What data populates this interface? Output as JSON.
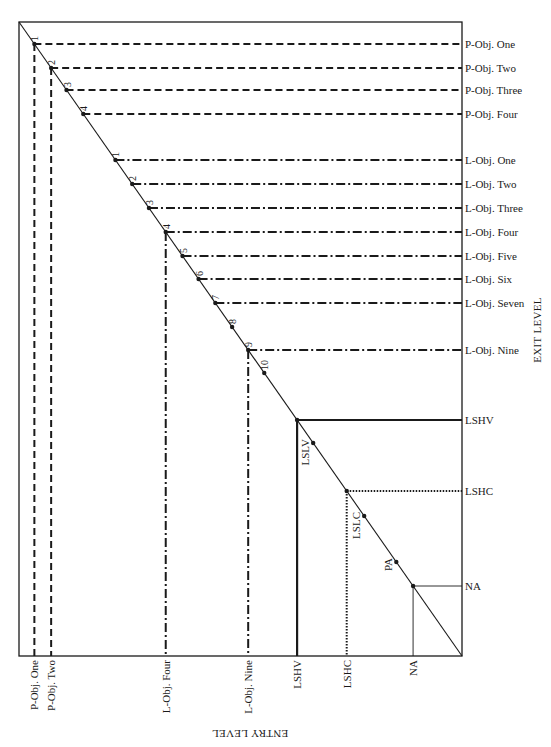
{
  "diagram": {
    "frame": {
      "x0": 19,
      "y0": 22,
      "x1": 462,
      "y1": 656
    },
    "axis_titles": {
      "exit_level": "EXIT LEVEL",
      "entry_level": "ENTRY LEVEL"
    },
    "p_objectives": [
      {
        "num": "1",
        "label": "P-Obj. One",
        "y": 44,
        "drop": true,
        "bottom_label": "P-Obj. One"
      },
      {
        "num": "2",
        "label": "P-Obj. Two",
        "y": 68,
        "drop": true,
        "bottom_label": "P-Obj. Two"
      },
      {
        "num": "3",
        "label": "P-Obj. Three",
        "y": 90,
        "drop": false
      },
      {
        "num": "4",
        "label": "P-Obj. Four",
        "y": 114,
        "drop": false
      }
    ],
    "l_objectives": [
      {
        "num": "1",
        "label": "L-Obj. One",
        "y": 160,
        "line": true
      },
      {
        "num": "2",
        "label": "L-Obj. Two",
        "y": 184,
        "line": true
      },
      {
        "num": "3",
        "label": "L-Obj. Three",
        "y": 208,
        "line": true
      },
      {
        "num": "4",
        "label": "L-Obj. Four",
        "y": 232,
        "line": true,
        "drop": true,
        "bottom_label": "L-Obj. Four"
      },
      {
        "num": "5",
        "label": "L-Obj. Five",
        "y": 256,
        "line": true
      },
      {
        "num": "6",
        "label": "L-Obj. Six",
        "y": 279,
        "line": true
      },
      {
        "num": "7",
        "label": "L-Obj. Seven",
        "y": 303,
        "line": true
      },
      {
        "num": "8",
        "label": "",
        "y": 327,
        "line": false
      },
      {
        "num": "9",
        "label": "L-Obj. Nine",
        "y": 350,
        "line": true,
        "drop": true,
        "bottom_label": "L-Obj. Nine"
      },
      {
        "num": "10",
        "label": "",
        "y": 373,
        "line": false
      }
    ],
    "levels": [
      {
        "id": "LSHV",
        "label": "LSHV",
        "y": 420,
        "style": "solid-thick",
        "bottom_label": "LSHV"
      },
      {
        "id": "LSHC",
        "label": "LSHC",
        "y": 491,
        "style": "dotted",
        "bottom_label": "LSHC"
      },
      {
        "id": "NA",
        "label": "NA",
        "y": 586,
        "style": "solid-thin",
        "bottom_label": "NA"
      }
    ],
    "points_on_diagonal": [
      {
        "label": "LSLV",
        "y": 443
      },
      {
        "label": "LSLC",
        "y": 516
      },
      {
        "label": "PA",
        "y": 562
      }
    ],
    "colors": {
      "ink": "#1a1a1a",
      "background": "#ffffff"
    }
  }
}
